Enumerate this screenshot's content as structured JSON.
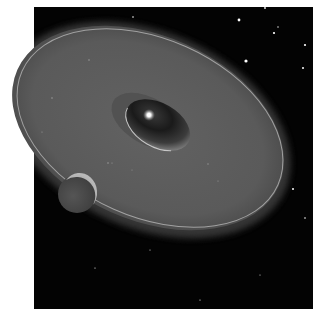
{
  "image": {
    "description": "Artist illustration of a protoplanetary disk around a young star with an inner cleared cavity and a planet embedded at the disk's edge, set against a starfield",
    "colors": {
      "space": "#030303",
      "disk": "#5a5a5a",
      "disk_rim": "#b8b8b8",
      "cavity_dark": "#1c1c1c",
      "star": "#ffffff",
      "planet": "#505050",
      "planet_lit_edge": "#c9c9c9",
      "page": "#ffffff"
    },
    "elements": {
      "starfield": "background-starfield",
      "disk": "protoplanetary-disk",
      "cavity": "inner-cavity",
      "star": "central-star",
      "planet": "planet"
    }
  }
}
